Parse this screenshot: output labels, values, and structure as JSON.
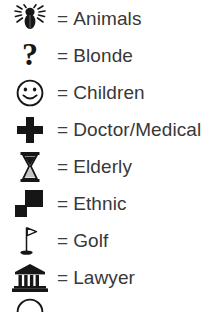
{
  "legend": {
    "separator": "=",
    "text_color": "#383838",
    "icon_color": "#1a1a1a",
    "background": "#ffffff",
    "rows": [
      {
        "icon": "spider-icon",
        "label": "Animals"
      },
      {
        "icon": "question-mark-icon",
        "label": "Blonde"
      },
      {
        "icon": "smiley-face-icon",
        "label": "Children"
      },
      {
        "icon": "medical-cross-icon",
        "label": "Doctor/Medical"
      },
      {
        "icon": "hourglass-icon",
        "label": "Elderly"
      },
      {
        "icon": "two-squares-icon",
        "label": "Ethnic"
      },
      {
        "icon": "golf-flag-icon",
        "label": "Golf"
      },
      {
        "icon": "courthouse-icon",
        "label": "Lawyer"
      },
      {
        "icon": "arc-icon",
        "label": ""
      }
    ]
  }
}
